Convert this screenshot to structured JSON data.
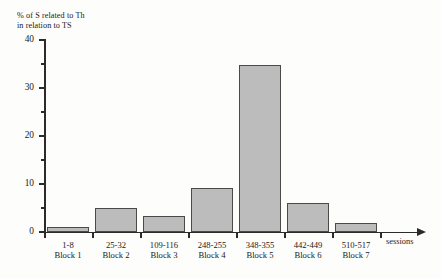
{
  "chart_data": {
    "type": "bar",
    "title": "",
    "ylabel": "% of S related to Th\nin relation to TS",
    "xlabel": "sessions",
    "categories": [
      "1-8\nBlock 1",
      "25-32\nBlock 2",
      "109-116\nBlock 3",
      "248-255\nBlock 4",
      "348-355\nBlock 5",
      "442-449\nBlock 6",
      "510-517\nBlock 7"
    ],
    "category_sessions": [
      "1-8",
      "25-32",
      "109-116",
      "248-255",
      "348-355",
      "442-449",
      "510-517"
    ],
    "category_blocks": [
      "Block 1",
      "Block 2",
      "Block 3",
      "Block 4",
      "Block 5",
      "Block 6",
      "Block 7"
    ],
    "values": [
      1.0,
      5.0,
      3.3,
      9.2,
      34.8,
      6.1,
      1.9
    ],
    "ylim": [
      0,
      40
    ],
    "ytick_labels": [
      "0",
      "10",
      "20",
      "30",
      "40"
    ],
    "ytick_values": [
      0,
      10,
      20,
      30,
      40
    ],
    "yminor_values": [
      5,
      15,
      25,
      35
    ],
    "grid": false,
    "legend": null,
    "bar_fill_color": "#bcbcbc",
    "bar_edge_color": "#4a4a4a",
    "axis_color": "#2b2b2b",
    "background_color": "#fdfdfc"
  }
}
